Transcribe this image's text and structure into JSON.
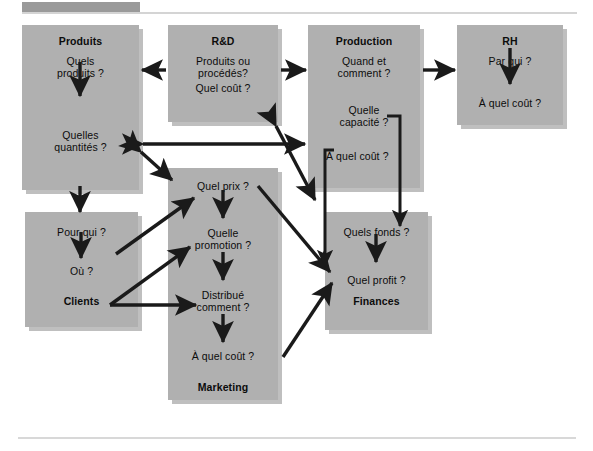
{
  "page": {
    "background": "#ffffff",
    "box_color": "#b0b0b0",
    "line_color": "#1a1a1a"
  },
  "boxes": [
    {
      "id": "produits",
      "title": "Produits",
      "lines": [
        "Quels",
        "produits ?",
        "Quelles",
        "quantités ?"
      ]
    },
    {
      "id": "rd",
      "title": "R&D",
      "lines": [
        "Produits ou",
        "procédés?",
        "Quel coût ?"
      ]
    },
    {
      "id": "production",
      "title": "Production",
      "lines": [
        "Quand et",
        "comment ?",
        "Quelle",
        "capacité ?",
        "À quel coût ?"
      ]
    },
    {
      "id": "rh",
      "title": "RH",
      "lines": [
        "Par qui ?",
        "À quel coût ?"
      ]
    },
    {
      "id": "clients",
      "title": "Clients",
      "lines": [
        "Pour qui ?",
        "Où ?"
      ]
    },
    {
      "id": "marketing",
      "title": "Marketing",
      "lines": [
        "Quel prix ?",
        "Quelle",
        "promotion ?",
        "Distribué",
        "comment ?",
        "À quel coût ?"
      ]
    },
    {
      "id": "finances",
      "title": "Finances",
      "lines": [
        "Quels fonds ?",
        "Quel profit ?"
      ]
    }
  ],
  "labels": {
    "produits_title": "Produits",
    "produits_q1a": "Quels",
    "produits_q1b": "produits ?",
    "produits_q2a": "Quelles",
    "produits_q2b": "quantités ?",
    "rd_title": "R&D",
    "rd_q1a": "Produits ou",
    "rd_q1b": "procédés?",
    "rd_q2": "Quel coût ?",
    "production_title": "Production",
    "production_q1a": "Quand et",
    "production_q1b": "comment ?",
    "production_q2a": "Quelle",
    "production_q2b": "capacité ?",
    "production_q3": "À quel coût ?",
    "rh_title": "RH",
    "rh_q1": "Par qui ?",
    "rh_q2": "À quel coût ?",
    "clients_title": "Clients",
    "clients_q1": "Pour qui ?",
    "clients_q2": "Où ?",
    "marketing_title": "Marketing",
    "marketing_q1": "Quel prix ?",
    "marketing_q2a": "Quelle",
    "marketing_q2b": "promotion ?",
    "marketing_q3a": "Distribué",
    "marketing_q3b": "comment ?",
    "marketing_q4": "À quel coût ?",
    "finances_title": "Finances",
    "finances_q1": "Quels fonds ?",
    "finances_q2": "Quel profit ?"
  }
}
